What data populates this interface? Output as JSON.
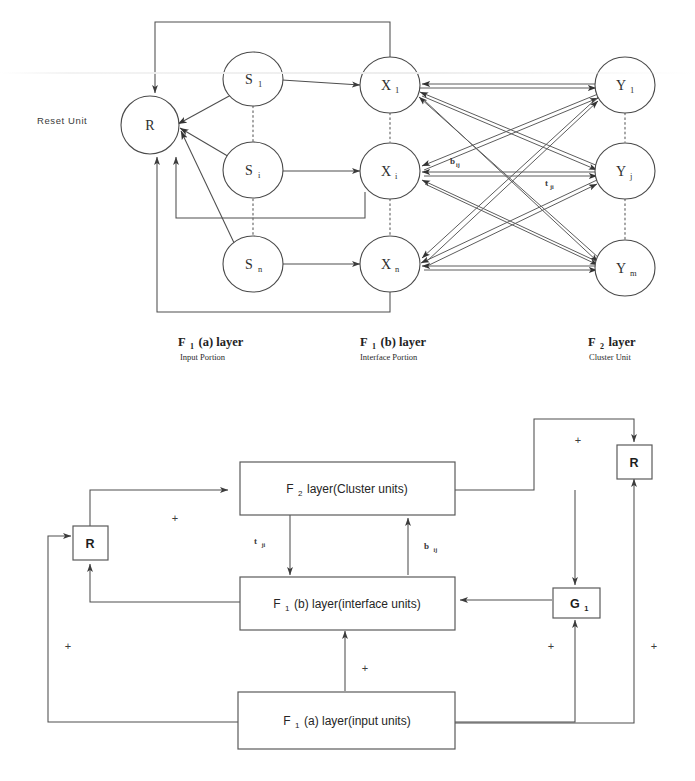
{
  "figure": {
    "top_diagram": {
      "reset_unit_label": "Reset  Unit",
      "reset_node": {
        "label": "R"
      },
      "f1a_nodes": [
        {
          "label": "S",
          "sub": "1"
        },
        {
          "label": "S",
          "sub": "i"
        },
        {
          "label": "S",
          "sub": "n"
        }
      ],
      "f1b_nodes": [
        {
          "label": "X",
          "sub": "1"
        },
        {
          "label": "X",
          "sub": "i"
        },
        {
          "label": "X",
          "sub": "n"
        }
      ],
      "f2_nodes": [
        {
          "label": "Y",
          "sub": "1"
        },
        {
          "label": "Y",
          "sub": "j"
        },
        {
          "label": "Y",
          "sub": "m"
        }
      ],
      "weights": [
        {
          "label": "b",
          "sub": "ij"
        },
        {
          "label": "t",
          "sub": "ji"
        }
      ],
      "captions": [
        {
          "main": "F",
          "main_sub": "1",
          "main_rest": "(a) layer",
          "sub": "Input Portion"
        },
        {
          "main": "F",
          "main_sub": "1",
          "main_rest": "(b) layer",
          "sub": "Interface Portion"
        },
        {
          "main": "F",
          "main_sub": "2",
          "main_rest": " layer",
          "sub": "Cluster Unit"
        }
      ]
    },
    "bottom_diagram": {
      "boxes": [
        {
          "name": "f2-layer-box",
          "prefix": "F",
          "prefix_sub": "2",
          "text": " layer(Cluster units)"
        },
        {
          "name": "f1b-layer-box",
          "prefix": "F",
          "prefix_sub": "1",
          "text": "(b) layer(interface units)"
        },
        {
          "name": "f1a-layer-box",
          "prefix": "F",
          "prefix_sub": "1",
          "text": "(a) layer(input units)"
        }
      ],
      "reset_left": {
        "label": "R"
      },
      "reset_right": {
        "label": "R"
      },
      "gain_unit": {
        "label": "G",
        "sub": "1"
      },
      "weights": [
        {
          "label": "t",
          "sub": "ji"
        },
        {
          "label": "b",
          "sub": "ij"
        }
      ],
      "plus_signs": [
        "+",
        "+",
        "+",
        "+",
        "+",
        "+",
        "+"
      ]
    }
  },
  "colors": {
    "stroke": "#4e4e4e",
    "text": "#262626",
    "background": "#ffffff"
  }
}
